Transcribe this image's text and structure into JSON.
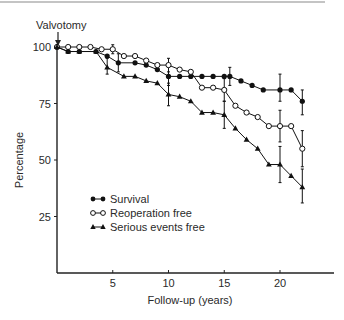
{
  "chart_data": {
    "type": "line",
    "title": "",
    "annotation": "Valvotomy",
    "xlabel": "Follow-up (years)",
    "ylabel": "Percentage",
    "xlim": [
      0,
      24
    ],
    "ylim": [
      0,
      100
    ],
    "xticks": [
      5,
      10,
      15,
      20
    ],
    "yticks": [
      25,
      50,
      75,
      100
    ],
    "grid": false,
    "legend_position": "lower-left",
    "series": [
      {
        "name": "Survival",
        "marker": "filled-circle",
        "x": [
          0,
          1,
          2,
          3.5,
          4.5,
          5.5,
          7,
          8,
          9,
          10,
          11,
          12,
          13,
          14,
          15,
          15.5,
          16.5,
          17.5,
          18.5,
          20,
          21,
          22
        ],
        "y": [
          100,
          98,
          98,
          98,
          96,
          93,
          93,
          92,
          90,
          87,
          87,
          87,
          87,
          87,
          87,
          87,
          85,
          83,
          81,
          81,
          81,
          76
        ],
        "error_bars": [
          {
            "x": 5.5,
            "low": 89,
            "high": 97
          },
          {
            "x": 10,
            "low": 83,
            "high": 91
          },
          {
            "x": 15.5,
            "low": 83,
            "high": 91
          },
          {
            "x": 20,
            "low": 76,
            "high": 88
          },
          {
            "x": 22,
            "low": 70,
            "high": 81
          }
        ]
      },
      {
        "name": "Reoperation free",
        "marker": "open-circle",
        "x": [
          0,
          1,
          2,
          3,
          4,
          5,
          6,
          7,
          8,
          9,
          10,
          11,
          12,
          13,
          14,
          15,
          16,
          17,
          18,
          19,
          20,
          21,
          22
        ],
        "y": [
          100,
          100,
          100,
          100,
          99,
          99,
          96,
          96,
          94,
          92,
          92,
          90,
          89,
          82,
          82,
          81,
          74,
          71,
          69,
          65,
          65,
          65,
          55
        ],
        "error_bars": [
          {
            "x": 5,
            "low": 97,
            "high": 101
          },
          {
            "x": 10,
            "low": 89,
            "high": 95
          },
          {
            "x": 15,
            "low": 76,
            "high": 86
          },
          {
            "x": 20,
            "low": 58,
            "high": 72
          },
          {
            "x": 22,
            "low": 47,
            "high": 63
          }
        ]
      },
      {
        "name": "Serious events free",
        "marker": "filled-triangle",
        "x": [
          0,
          1,
          2,
          3.5,
          4.5,
          6,
          7,
          8,
          9,
          10,
          11,
          12,
          13,
          14,
          15,
          16,
          17,
          18,
          19,
          20,
          21,
          22
        ],
        "y": [
          100,
          98,
          98,
          98,
          91,
          87,
          87,
          85,
          84,
          79,
          78,
          76,
          71,
          71,
          70,
          64,
          59,
          55,
          48,
          48,
          43,
          38
        ],
        "error_bars": [
          {
            "x": 4.5,
            "low": 88,
            "high": 95
          },
          {
            "x": 10,
            "low": 74,
            "high": 84
          },
          {
            "x": 15,
            "low": 64,
            "high": 76
          },
          {
            "x": 20,
            "low": 40,
            "high": 56
          },
          {
            "x": 22,
            "low": 31,
            "high": 46
          }
        ]
      }
    ]
  },
  "plot_layout": {
    "origin_px": [
      57,
      273
    ],
    "px_per_year": 11.15,
    "px_per_pct": 2.26,
    "x_axis_end_px": 334,
    "top_rule": {
      "x1": 0,
      "x2": 325,
      "y": 2
    }
  }
}
